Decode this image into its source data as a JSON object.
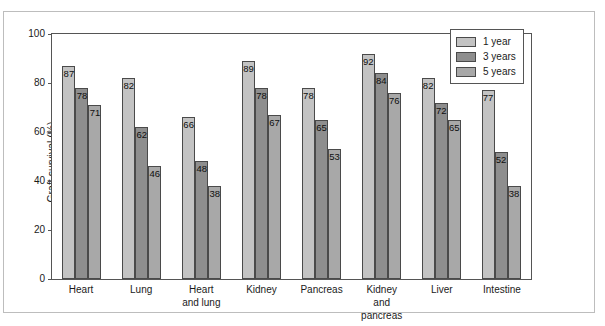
{
  "chart_data": {
    "type": "bar",
    "title": "",
    "subtitle": "",
    "xlabel": "",
    "ylabel": "Graft survival (%)",
    "ylim": [
      0,
      100
    ],
    "yticks": [
      0,
      20,
      40,
      60,
      80,
      100
    ],
    "ytick_labels": [
      "0",
      "20",
      "40",
      "60",
      "80",
      "100"
    ],
    "grid": false,
    "legend_position": "top-right",
    "categories": [
      "Heart",
      "Lung",
      "Heart\nand lung",
      "Kidney",
      "Pancreas",
      "Kidney\nand\npancreas",
      "Liver",
      "Intestine"
    ],
    "category_lines": [
      [
        "Heart"
      ],
      [
        "Lung"
      ],
      [
        "Heart",
        "and lung"
      ],
      [
        "Kidney"
      ],
      [
        "Pancreas"
      ],
      [
        "Kidney",
        "and",
        "pancreas"
      ],
      [
        "Liver"
      ],
      [
        "Intestine"
      ]
    ],
    "series": [
      {
        "name": "1 year",
        "color": "#c3c3c3",
        "values": [
          87,
          82,
          66,
          89,
          78,
          92,
          82,
          77
        ]
      },
      {
        "name": "3 years",
        "color": "#8e8e8e",
        "values": [
          78,
          62,
          48,
          78,
          65,
          84,
          72,
          52
        ]
      },
      {
        "name": "5 years",
        "color": "#a8a8a8",
        "values": [
          71,
          46,
          38,
          67,
          53,
          76,
          65,
          38
        ]
      }
    ]
  },
  "legend": {
    "items": [
      {
        "label": "1 year",
        "color": "#c3c3c3"
      },
      {
        "label": "3 years",
        "color": "#8e8e8e"
      },
      {
        "label": "5 years",
        "color": "#a8a8a8"
      }
    ]
  },
  "colors": {
    "axis": "#555555",
    "frame": "#bdbdbd",
    "text": "#1a1a1a",
    "background": "#ffffff",
    "bar_outline": "#4a4a4a"
  }
}
